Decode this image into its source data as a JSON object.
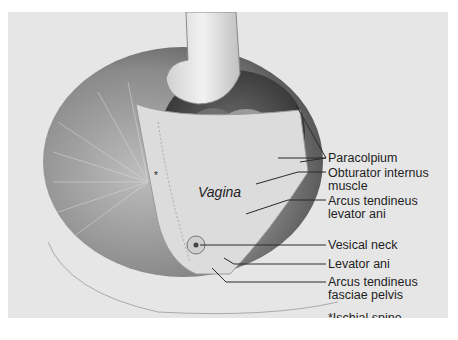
{
  "figure": {
    "colors": {
      "background": "#e6e6e6",
      "dark_cavity": "#4a4a4a",
      "tissue_light": "#d8d8d8",
      "line": "#2a2a2a"
    },
    "inline_labels": {
      "vagina": "Vagina",
      "star": "*"
    },
    "labels": [
      {
        "id": "paracolpium",
        "text": "Paracolpium"
      },
      {
        "id": "obturator-internus",
        "text": "Obturator internus muscle"
      },
      {
        "id": "obturator-line1",
        "text": "Obturator internus"
      },
      {
        "id": "obturator-line2",
        "text": "muscle"
      },
      {
        "id": "arcus-levator-line1",
        "text": "Arcus tendineus"
      },
      {
        "id": "arcus-levator-line2",
        "text": "levator ani"
      },
      {
        "id": "vesical-neck",
        "text": "Vesical neck"
      },
      {
        "id": "levator-ani",
        "text": "Levator ani"
      },
      {
        "id": "arcus-fasciae-line1",
        "text": "Arcus tendineus"
      },
      {
        "id": "arcus-fasciae-line2",
        "text": "fasciae pelvis"
      }
    ],
    "footnote": "*Ischial spine"
  }
}
